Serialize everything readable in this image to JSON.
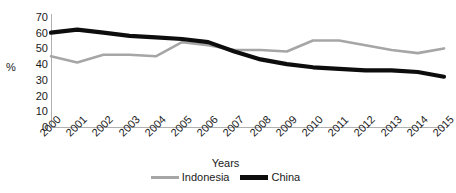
{
  "chart_data": {
    "type": "line",
    "title": "",
    "xlabel": "Years",
    "ylabel": "%",
    "x": [
      "2000",
      "2001",
      "2002",
      "2003",
      "2004",
      "2005",
      "2006",
      "2007",
      "2008",
      "2009",
      "2010",
      "2011",
      "2012",
      "2013",
      "2014",
      "2015"
    ],
    "categories": [
      "2000",
      "2001",
      "2002",
      "2003",
      "2004",
      "2005",
      "2006",
      "2007",
      "2008",
      "2009",
      "2010",
      "2011",
      "2012",
      "2013",
      "2014",
      "2015"
    ],
    "series": [
      {
        "name": "Indonesia",
        "color": "#a6a6a6",
        "values": [
          45,
          41,
          46,
          46,
          45,
          54,
          52,
          49,
          49,
          48,
          55,
          55,
          52,
          49,
          47,
          50
        ]
      },
      {
        "name": "China",
        "color": "#0d0d0d",
        "values": [
          60,
          62,
          60,
          58,
          57,
          56,
          54,
          48,
          43,
          40,
          38,
          37,
          36,
          36,
          35,
          32
        ]
      }
    ],
    "ylim": [
      0,
      70
    ],
    "yticks": [
      0,
      10,
      20,
      30,
      40,
      50,
      60,
      70
    ],
    "ytick_labels": [
      "0",
      "10",
      "20",
      "30",
      "40",
      "50",
      "60",
      "70"
    ],
    "grid": false,
    "legend_position": "bottom"
  },
  "legend": {
    "entries": [
      {
        "label": "Indonesia",
        "swatch": "gray-thin-line-swatch"
      },
      {
        "label": "China",
        "swatch": "black-thick-line-swatch"
      }
    ]
  }
}
